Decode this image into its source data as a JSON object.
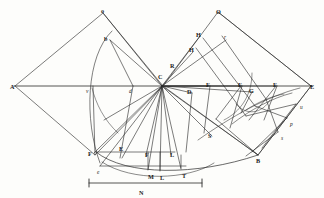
{
  "figure": {
    "kind": "geometric-construction-plate",
    "background_color": "#fdfdfb",
    "ink_color": "#262626",
    "caption_note": "N",
    "width": 324,
    "height": 198
  },
  "labels": {
    "capitals": [
      {
        "id": "A",
        "text": "A",
        "x": 10,
        "y": 84
      },
      {
        "id": "o",
        "text": "o",
        "x": 101,
        "y": 8
      },
      {
        "id": "b",
        "text": "b",
        "x": 104,
        "y": 36
      },
      {
        "id": "C",
        "text": "C",
        "x": 158,
        "y": 74
      },
      {
        "id": "R",
        "text": "R",
        "x": 170,
        "y": 63
      },
      {
        "id": "H1",
        "text": "H",
        "x": 189,
        "y": 47
      },
      {
        "id": "H2",
        "text": "H",
        "x": 196,
        "y": 32
      },
      {
        "id": "O",
        "text": "O",
        "x": 216,
        "y": 9
      },
      {
        "id": "D",
        "text": "D",
        "x": 187,
        "y": 89
      },
      {
        "id": "F1",
        "text": "F",
        "x": 206,
        "y": 82
      },
      {
        "id": "F2",
        "text": "F",
        "x": 238,
        "y": 82
      },
      {
        "id": "G",
        "text": "G",
        "x": 249,
        "y": 88
      },
      {
        "id": "F3",
        "text": "F",
        "x": 273,
        "y": 82
      },
      {
        "id": "E",
        "text": "E",
        "x": 310,
        "y": 84
      },
      {
        "id": "S",
        "text": "S",
        "x": 208,
        "y": 133
      },
      {
        "id": "B",
        "text": "B",
        "x": 256,
        "y": 158
      },
      {
        "id": "Fl",
        "text": "F",
        "x": 88,
        "y": 151
      },
      {
        "id": "Fm",
        "text": "F",
        "x": 145,
        "y": 152
      },
      {
        "id": "Em",
        "text": "E",
        "x": 119,
        "y": 146
      },
      {
        "id": "L1",
        "text": "L",
        "x": 170,
        "y": 152
      },
      {
        "id": "M",
        "text": "M",
        "x": 148,
        "y": 174
      },
      {
        "id": "L2",
        "text": "L",
        "x": 160,
        "y": 175
      },
      {
        "id": "T",
        "text": "T",
        "x": 182,
        "y": 173
      },
      {
        "id": "N",
        "text": "N",
        "x": 139,
        "y": 190
      }
    ],
    "lowercase": [
      {
        "id": "v",
        "text": "v",
        "x": 86,
        "y": 89
      },
      {
        "id": "d",
        "text": "d",
        "x": 129,
        "y": 89
      },
      {
        "id": "r",
        "text": "r",
        "x": 224,
        "y": 35
      },
      {
        "id": "u",
        "text": "u",
        "x": 300,
        "y": 105
      },
      {
        "id": "p",
        "text": "p",
        "x": 290,
        "y": 122
      },
      {
        "id": "s",
        "text": "s",
        "x": 281,
        "y": 136
      },
      {
        "id": "e",
        "text": "e",
        "x": 97,
        "y": 170
      }
    ]
  },
  "scale_bar": {
    "label": "N",
    "left_tick_x": 88,
    "right_tick_x": 203,
    "y": 183
  },
  "geometry": {
    "axis": {
      "x1": 14,
      "y1": 86,
      "x2": 312,
      "y2": 86
    },
    "hub": {
      "x": 162,
      "y": 86
    },
    "description": "Radial fan of rays from hub C with two kite-shaped wings, arcs and a lower catenary-like curve."
  }
}
